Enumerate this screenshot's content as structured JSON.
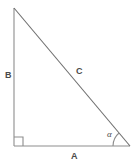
{
  "figure": {
    "type": "right-triangle-diagram",
    "background_color": "#ffffff",
    "stroke_color": "#8d8d8d",
    "hypotenuse_color": "#6e6e6e",
    "text_color": "#4a4a4a",
    "width": 140,
    "height": 166
  },
  "labels": {
    "side_vertical": "B",
    "side_hypotenuse": "C",
    "side_base": "A",
    "angle": "α"
  },
  "geometry": {
    "apex": {
      "x": 14,
      "y": 8
    },
    "right_angle_vertex": {
      "x": 14,
      "y": 146
    },
    "alpha_vertex": {
      "x": 130,
      "y": 146
    },
    "right_angle_marker_size": 9,
    "angle_arc_radius": 17
  },
  "markers": {
    "right_angle_name": "right-angle-square",
    "angle_arc_name": "alpha-angle-arc"
  }
}
